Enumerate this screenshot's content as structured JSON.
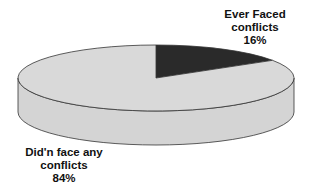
{
  "chart_data": {
    "type": "pie",
    "style": "3d",
    "title": "",
    "slices": [
      {
        "label_line1": "Ever Faced",
        "label_line2": "conflicts",
        "value": 16,
        "value_text": "16%",
        "color": "#2a2a2a"
      },
      {
        "label_line1": "Did'n face any",
        "label_line2": "conflicts",
        "value": 84,
        "value_text": "84%",
        "color": "#d9d9d9"
      }
    ],
    "start_angle": "12 o'clock",
    "direction": "clockwise",
    "legend": "none"
  }
}
